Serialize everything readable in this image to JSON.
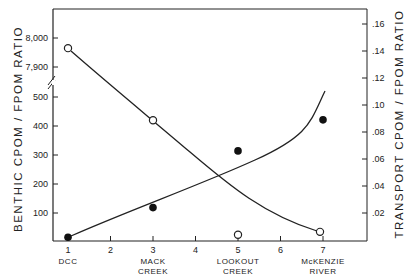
{
  "chart_data": {
    "type": "line",
    "title": "",
    "xlabel": "",
    "ylabel": "BENTHIC CPOM / FPOM RATIO",
    "ylabel_right": "TRANSPORT CPOM / FPOM RATIO",
    "x_ticks": [
      1,
      2,
      3,
      4,
      5,
      6,
      7
    ],
    "x_tick_labels": [
      "1",
      "2",
      "3",
      "4",
      "5",
      "6",
      "7"
    ],
    "x_categories": [
      {
        "x": 1,
        "line1": "DCC",
        "line2": ""
      },
      {
        "x": 3,
        "line1": "MACK",
        "line2": "CREEK"
      },
      {
        "x": 5,
        "line1": "LOOKOUT",
        "line2": "CREEK"
      },
      {
        "x": 7,
        "line1": "McKENZIE",
        "line2": "RIVER"
      }
    ],
    "y_left": {
      "ticks_lower": [
        "100",
        "200",
        "300",
        "400",
        "500"
      ],
      "ticks_upper": [
        "7,900",
        "8,000"
      ],
      "axis_break": true,
      "ylim_lower": [
        0,
        500
      ],
      "ylim_upper": [
        7900,
        8000
      ]
    },
    "y_right": {
      "ticks": [
        ".02",
        ".04",
        ".06",
        ".08",
        ".10",
        ".12",
        ".14",
        ".16"
      ],
      "ylim": [
        0,
        0.17
      ]
    },
    "grid": false,
    "legend": "none",
    "series": [
      {
        "name": "Benthic CPOM/FPOM ratio",
        "axis": "left",
        "marker": "open-circle",
        "x": [
          1,
          3,
          5,
          7
        ],
        "values": [
          7965,
          420,
          25,
          35
        ],
        "fit": "decreasing curve"
      },
      {
        "name": "Transport CPOM/FPOM ratio",
        "axis": "right",
        "marker": "filled-circle",
        "x": [
          1,
          3,
          5,
          7
        ],
        "values": [
          0.002,
          0.024,
          0.066,
          0.089
        ],
        "fit": "increasing exponential curve"
      }
    ]
  }
}
